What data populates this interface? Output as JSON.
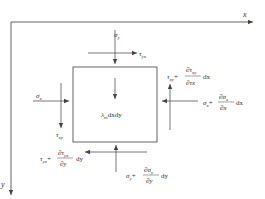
{
  "diagram": {
    "type": "stress-element-equilibrium",
    "axes": {
      "x_label": "x",
      "y_label": "y"
    },
    "element": {
      "body_force_label": "λ",
      "body_force_sub": "m",
      "body_force_tail": "dxdy"
    },
    "forces": {
      "top_normal": {
        "symbol": "σ",
        "sub": "y"
      },
      "top_shear": {
        "symbol": "τ",
        "sub": "yx"
      },
      "left_normal": {
        "symbol": "σ",
        "sub": "x"
      },
      "left_shear": {
        "symbol": "τ",
        "sub": "xy"
      },
      "right_normal": {
        "base": "σ",
        "base_sub": "x",
        "plus": "+",
        "num": "∂σ",
        "num_sub": "x",
        "den": "∂x",
        "tail": "dx"
      },
      "right_shear": {
        "base": "τ",
        "base_sub": "xy",
        "plus": "+",
        "num": "∂τ",
        "num_sub": "xy",
        "den": "∂τx",
        "tail": "dx"
      },
      "bottom_shear": {
        "base": "τ",
        "base_sub": "yx",
        "plus": "+",
        "num": "∂τ",
        "num_sub": "yx",
        "den": "∂y",
        "tail": "dy"
      },
      "bottom_normal": {
        "base": "σ",
        "base_sub": "y",
        "plus": "+",
        "num": "∂σ",
        "num_sub": "y",
        "den": "∂y",
        "tail": "dy"
      }
    },
    "colors": {
      "line": "#555555",
      "text": "#333333"
    }
  }
}
